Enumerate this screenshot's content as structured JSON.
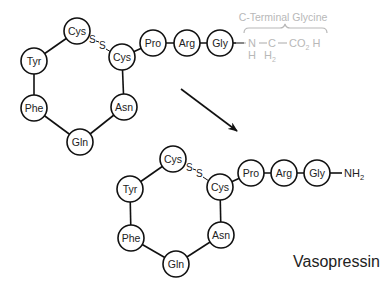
{
  "diagram": {
    "title": "Vasopressin",
    "colors": {
      "stroke": "#111111",
      "text": "#222222",
      "annotation_gray": "#b8b8b8",
      "background": "#ffffff"
    },
    "top_structure": {
      "residues": [
        {
          "id": "cys1",
          "label": "Cys",
          "cx": 77,
          "cy": 31
        },
        {
          "id": "tyr",
          "label": "Tyr",
          "cx": 34,
          "cy": 61
        },
        {
          "id": "phe",
          "label": "Phe",
          "cx": 34,
          "cy": 108
        },
        {
          "id": "gln",
          "label": "Gln",
          "cx": 80,
          "cy": 142
        },
        {
          "id": "asn",
          "label": "Asn",
          "cx": 124,
          "cy": 107
        },
        {
          "id": "cys6",
          "label": "Cys",
          "cx": 122,
          "cy": 57
        },
        {
          "id": "pro",
          "label": "Pro",
          "cx": 153,
          "cy": 43
        },
        {
          "id": "arg",
          "label": "Arg",
          "cx": 187,
          "cy": 43
        },
        {
          "id": "gly",
          "label": "Gly",
          "cx": 220,
          "cy": 43
        }
      ],
      "disulfide_label": [
        "S",
        "S"
      ],
      "c_terminal": {
        "label": "C-Terminal Glycine",
        "atoms": {
          "n": "N",
          "n_h": "H",
          "c": "C",
          "c_h2": "H",
          "c_h2_sub": "2",
          "co2h_co": "CO",
          "co2h_sub": "2",
          "co2h_h": "H"
        }
      }
    },
    "bottom_structure": {
      "residues": [
        {
          "id": "cys1",
          "label": "Cys",
          "cx": 173,
          "cy": 159
        },
        {
          "id": "tyr",
          "label": "Tyr",
          "cx": 130,
          "cy": 189
        },
        {
          "id": "phe",
          "label": "Phe",
          "cx": 131,
          "cy": 238
        },
        {
          "id": "gln",
          "label": "Gln",
          "cx": 176,
          "cy": 264
        },
        {
          "id": "asn",
          "label": "Asn",
          "cx": 221,
          "cy": 235
        },
        {
          "id": "cys6",
          "label": "Cys",
          "cx": 220,
          "cy": 187
        },
        {
          "id": "pro",
          "label": "Pro",
          "cx": 251,
          "cy": 173
        },
        {
          "id": "arg",
          "label": "Arg",
          "cx": 284,
          "cy": 173
        },
        {
          "id": "gly",
          "label": "Gly",
          "cx": 317,
          "cy": 173
        }
      ],
      "disulfide_label": [
        "S",
        "S"
      ],
      "terminal_group": {
        "base": "NH",
        "sub": "2"
      }
    },
    "arrow": {
      "x1": 181,
      "y1": 89,
      "x2": 237,
      "y2": 131
    }
  }
}
